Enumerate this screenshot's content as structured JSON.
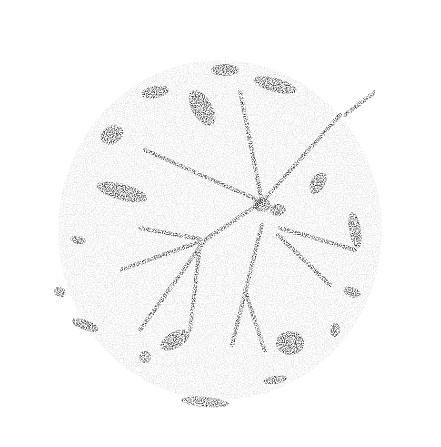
{
  "image": {
    "subject": "leaf print stipple",
    "background": "#ffffff",
    "ink": "#1a1a1a",
    "center": [
      262,
      202
    ],
    "veins": [
      {
        "x1": 262,
        "y1": 202,
        "x2": 340,
        "y2": 115
      },
      {
        "x1": 262,
        "y1": 202,
        "x2": 145,
        "y2": 150
      },
      {
        "x1": 262,
        "y1": 202,
        "x2": 240,
        "y2": 90
      },
      {
        "x1": 262,
        "y1": 202,
        "x2": 205,
        "y2": 240
      },
      {
        "x1": 205,
        "y1": 240,
        "x2": 140,
        "y2": 228
      },
      {
        "x1": 205,
        "y1": 240,
        "x2": 120,
        "y2": 270
      },
      {
        "x1": 205,
        "y1": 240,
        "x2": 140,
        "y2": 330
      },
      {
        "x1": 262,
        "y1": 225,
        "x2": 232,
        "y2": 345
      },
      {
        "x1": 245,
        "y1": 290,
        "x2": 265,
        "y2": 352
      },
      {
        "x1": 278,
        "y1": 235,
        "x2": 330,
        "y2": 285
      },
      {
        "x1": 200,
        "y1": 245,
        "x2": 190,
        "y2": 330
      },
      {
        "x1": 280,
        "y1": 228,
        "x2": 355,
        "y2": 250
      },
      {
        "x1": 345,
        "y1": 115,
        "x2": 375,
        "y2": 92
      }
    ],
    "blobs": [
      {
        "cx": 202,
        "cy": 108,
        "rx": 10,
        "ry": 20,
        "rot": -30
      },
      {
        "cx": 122,
        "cy": 192,
        "rx": 26,
        "ry": 8,
        "rot": 15
      },
      {
        "cx": 155,
        "cy": 92,
        "rx": 14,
        "ry": 6,
        "rot": -10
      },
      {
        "cx": 225,
        "cy": 70,
        "rx": 14,
        "ry": 6,
        "rot": 0
      },
      {
        "cx": 275,
        "cy": 85,
        "rx": 22,
        "ry": 7,
        "rot": 15
      },
      {
        "cx": 112,
        "cy": 135,
        "rx": 12,
        "ry": 9,
        "rot": -30
      },
      {
        "cx": 318,
        "cy": 183,
        "rx": 7,
        "ry": 12,
        "rot": 30
      },
      {
        "cx": 355,
        "cy": 230,
        "rx": 6,
        "ry": 18,
        "rot": -10
      },
      {
        "cx": 352,
        "cy": 292,
        "rx": 9,
        "ry": 5,
        "rot": 20
      },
      {
        "cx": 290,
        "cy": 343,
        "rx": 14,
        "ry": 12,
        "rot": 0
      },
      {
        "cx": 175,
        "cy": 340,
        "rx": 16,
        "ry": 8,
        "rot": -30
      },
      {
        "cx": 145,
        "cy": 357,
        "rx": 6,
        "ry": 6,
        "rot": 0
      },
      {
        "cx": 205,
        "cy": 402,
        "rx": 24,
        "ry": 5,
        "rot": 5
      },
      {
        "cx": 85,
        "cy": 325,
        "rx": 14,
        "ry": 5,
        "rot": 20
      },
      {
        "cx": 60,
        "cy": 292,
        "rx": 6,
        "ry": 5,
        "rot": 30
      },
      {
        "cx": 78,
        "cy": 240,
        "rx": 8,
        "ry": 4,
        "rot": 10
      },
      {
        "cx": 275,
        "cy": 380,
        "rx": 12,
        "ry": 4,
        "rot": -10
      },
      {
        "cx": 262,
        "cy": 205,
        "rx": 9,
        "ry": 7,
        "rot": 0
      },
      {
        "cx": 278,
        "cy": 210,
        "rx": 8,
        "ry": 6,
        "rot": 0
      },
      {
        "cx": 335,
        "cy": 330,
        "rx": 5,
        "ry": 7,
        "rot": 0
      }
    ]
  }
}
